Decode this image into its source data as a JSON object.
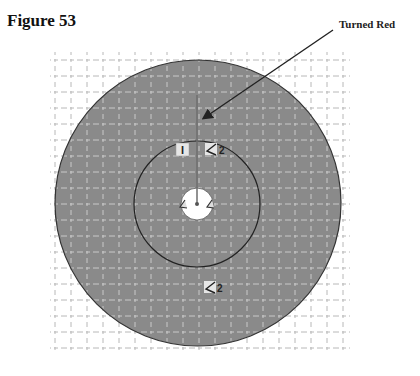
{
  "figure": {
    "title": "Figure 53"
  },
  "annotation": {
    "label": "Turned Red"
  },
  "diagram": {
    "outer_circle": {
      "cx": 198,
      "cy": 203,
      "r": 143,
      "fill": "#8c8c8c"
    },
    "inner_circle": {
      "cx": 197,
      "cy": 204,
      "r": 63
    },
    "center_hole": {
      "cx": 197,
      "cy": 204,
      "r": 16,
      "fill": "#ffffff"
    },
    "markers": [
      {
        "label": "I",
        "type": "box-label"
      },
      {
        "label": "2",
        "type": "angle-marker"
      },
      {
        "label": "2",
        "type": "angle-marker"
      }
    ],
    "grid": {
      "spacing": 16,
      "color": "#bdbdbd"
    }
  }
}
